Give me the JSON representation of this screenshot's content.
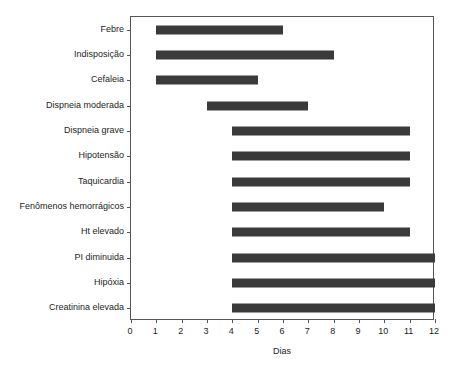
{
  "chart_data": {
    "type": "bar",
    "orientation": "horizontal",
    "subtype": "gantt-range-bars",
    "title": "",
    "xlabel": "Dias",
    "ylabel": "",
    "xlim": [
      0,
      12
    ],
    "xticks": [
      0,
      1,
      2,
      3,
      4,
      5,
      6,
      7,
      8,
      9,
      10,
      11,
      12
    ],
    "xtick_labels": [
      "0",
      "1",
      "2",
      "3",
      "4",
      "5",
      "6",
      "7",
      "8",
      "9",
      "10",
      "11",
      "12"
    ],
    "grid": false,
    "legend": null,
    "bar_color": "#3a3a3a",
    "axis_color": "#555555",
    "background": "#ffffff",
    "categories": [
      "Febre",
      "Indisposição",
      "Cefaleia",
      "Dispneia moderada",
      "Dispneia grave",
      "Hipotensão",
      "Taquicardia",
      "Fenômenos hemorrágicos",
      "Ht elevado",
      "PI diminuida",
      "Hipóxia",
      "Creatinina elevada"
    ],
    "bars": [
      {
        "label": "Febre",
        "start": 1,
        "end": 6
      },
      {
        "label": "Indisposição",
        "start": 1,
        "end": 8
      },
      {
        "label": "Cefaleia",
        "start": 1,
        "end": 5
      },
      {
        "label": "Dispneia moderada",
        "start": 3,
        "end": 7
      },
      {
        "label": "Dispneia grave",
        "start": 4,
        "end": 11
      },
      {
        "label": "Hipotensão",
        "start": 4,
        "end": 11
      },
      {
        "label": "Taquicardia",
        "start": 4,
        "end": 11
      },
      {
        "label": "Fenômenos hemorrágicos",
        "start": 4,
        "end": 10
      },
      {
        "label": "Ht elevado",
        "start": 4,
        "end": 11
      },
      {
        "label": "PI diminuida",
        "start": 4,
        "end": 12
      },
      {
        "label": "Hipóxia",
        "start": 4,
        "end": 12
      },
      {
        "label": "Creatinina elevada",
        "start": 4,
        "end": 12
      }
    ]
  }
}
